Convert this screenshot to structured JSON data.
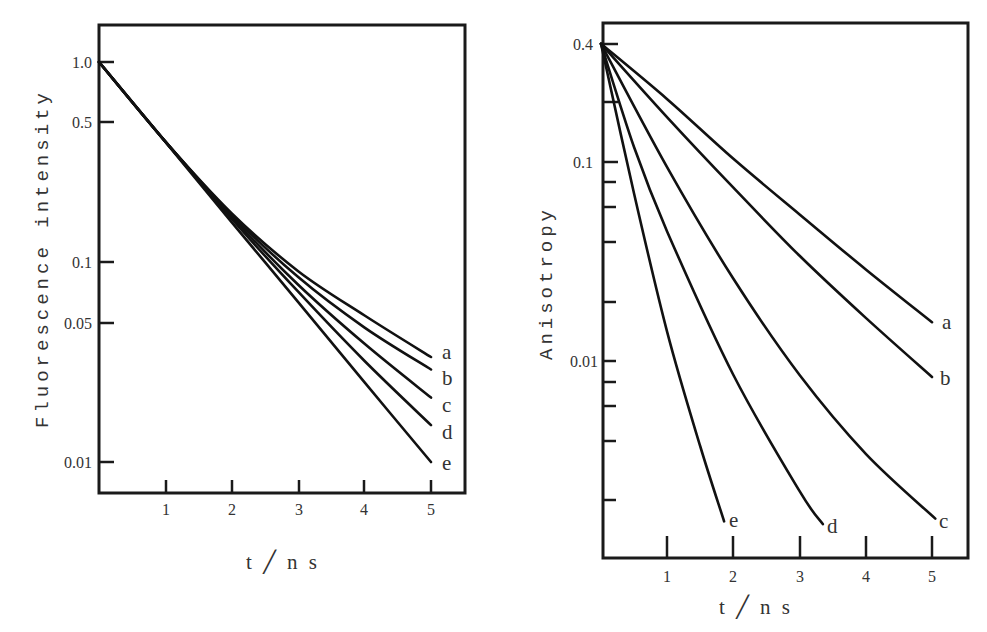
{
  "chart_data": [
    {
      "type": "line",
      "title": "",
      "xlabel": "t / n s",
      "ylabel": "Fluorescence intensity",
      "yscale": "log",
      "xlim": [
        0,
        5.5
      ],
      "ylim": [
        0.0071,
        1.53
      ],
      "grid": false,
      "legend": "inline labels at curve ends",
      "x_ticks": [
        1,
        2,
        3,
        4,
        5
      ],
      "x_tick_labels": [
        "1",
        "2",
        "3",
        "4",
        "5"
      ],
      "y_ticks": [
        1.0,
        0.5,
        0.1,
        0.05,
        0.01
      ],
      "y_tick_labels": [
        "1.0",
        "0.5",
        "0.1",
        "0.05",
        "0.01"
      ],
      "x": [
        0,
        1,
        2,
        3,
        4,
        5
      ],
      "series": [
        {
          "name": "a",
          "values": [
            1.0,
            0.4,
            0.175,
            0.09,
            0.054,
            0.0335
          ]
        },
        {
          "name": "b",
          "values": [
            1.0,
            0.4,
            0.172,
            0.084,
            0.047,
            0.029
          ]
        },
        {
          "name": "c",
          "values": [
            1.0,
            0.4,
            0.168,
            0.077,
            0.039,
            0.021
          ]
        },
        {
          "name": "d",
          "values": [
            1.0,
            0.4,
            0.164,
            0.071,
            0.032,
            0.0153
          ]
        },
        {
          "name": "e",
          "values": [
            1.0,
            0.398,
            0.158,
            0.063,
            0.025,
            0.01
          ]
        }
      ]
    },
    {
      "type": "line",
      "title": "",
      "xlabel": "t / n s",
      "ylabel": "Anisotropy",
      "yscale": "log",
      "xlim": [
        0,
        5.5
      ],
      "ylim": [
        0.001,
        0.55
      ],
      "grid": false,
      "legend": "inline labels at curve ends",
      "x_ticks": [
        1,
        2,
        3,
        4,
        5
      ],
      "x_tick_labels": [
        "1",
        "2",
        "3",
        "4",
        "5"
      ],
      "y_ticks": [
        0.4,
        0.2,
        0.1,
        0.08,
        0.06,
        0.04,
        0.02,
        0.01,
        0.008,
        0.006,
        0.004,
        0.002
      ],
      "y_tick_labels": [
        "0.4",
        "",
        "0.1",
        "",
        "",
        "",
        "",
        "0.01",
        "",
        "",
        "",
        ""
      ],
      "series": [
        {
          "name": "a",
          "x": [
            0,
            1,
            2,
            3,
            4,
            5.0
          ],
          "values": [
            0.4,
            0.21,
            0.105,
            0.055,
            0.029,
            0.0157
          ]
        },
        {
          "name": "b",
          "x": [
            0,
            1,
            2,
            3,
            4,
            5.0
          ],
          "values": [
            0.4,
            0.17,
            0.075,
            0.034,
            0.0165,
            0.0083
          ]
        },
        {
          "name": "c",
          "x": [
            0,
            1,
            2,
            3,
            4,
            5.05
          ],
          "values": [
            0.4,
            0.095,
            0.026,
            0.0085,
            0.0034,
            0.0016
          ]
        },
        {
          "name": "d",
          "x": [
            0,
            0.5,
            1,
            2,
            3,
            3.35
          ],
          "values": [
            0.4,
            0.12,
            0.045,
            0.0085,
            0.0022,
            0.0015
          ]
        },
        {
          "name": "e",
          "x": [
            0,
            0.5,
            1,
            1.5,
            1.86
          ],
          "values": [
            0.4,
            0.07,
            0.014,
            0.0037,
            0.00155
          ]
        }
      ]
    }
  ],
  "left_chart": {
    "ylabel": "Fluorescence intensity",
    "xlabel": "t ╱ n s",
    "y_tick_labels": [
      "1.0",
      "0.5",
      "0.1",
      "0.05",
      "0.01"
    ],
    "x_tick_labels": [
      "1",
      "2",
      "3",
      "4",
      "5"
    ],
    "curve_labels": [
      "a",
      "b",
      "c",
      "d",
      "e"
    ]
  },
  "right_chart": {
    "ylabel": "Anisotropy",
    "xlabel": "t ╱ n s",
    "y_tick_labels": [
      "0.4",
      "0.1",
      "0.01"
    ],
    "x_tick_labels": [
      "1",
      "2",
      "3",
      "4",
      "5"
    ],
    "curve_labels": [
      "a",
      "b",
      "c",
      "d",
      "e"
    ]
  }
}
